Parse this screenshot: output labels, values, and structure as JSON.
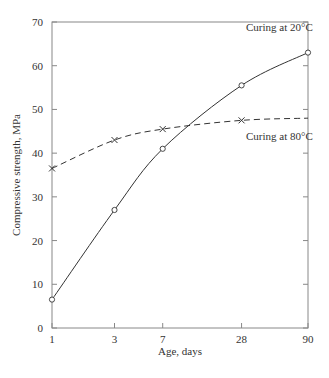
{
  "chart_data": {
    "type": "line",
    "title": "",
    "xlabel": "Age, days",
    "ylabel": "Compressive strength, MPa",
    "x_scale": "log",
    "x_ticks": [
      "1",
      "3",
      "7",
      "28",
      "90"
    ],
    "y_ticks": [
      "0",
      "10",
      "20",
      "30",
      "40",
      "50",
      "60",
      "70"
    ],
    "ylim": [
      0,
      70
    ],
    "grid": false,
    "series": [
      {
        "name": "Curing at 20°C",
        "style": "solid",
        "marker": "circle",
        "x": [
          1,
          3,
          7,
          28,
          90
        ],
        "values": [
          6.5,
          27,
          41,
          55.5,
          63
        ]
      },
      {
        "name": "Curing at 80°C",
        "style": "dashed",
        "marker": "x",
        "x": [
          1,
          3,
          7,
          28,
          90
        ],
        "values": [
          36.5,
          43,
          45.5,
          47.5,
          48
        ]
      }
    ]
  }
}
